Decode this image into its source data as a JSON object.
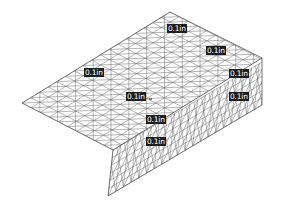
{
  "figure": {
    "colors": {
      "background": "#ffffff",
      "mesh_line": "#6e6e6e",
      "outline": "#555555",
      "label_bg": "#1e1e1e",
      "label_text": "#ffffff"
    },
    "labels": [
      {
        "text": "0.1in",
        "x": 167,
        "y": 24
      },
      {
        "text": "0.1in",
        "x": 206,
        "y": 46
      },
      {
        "text": "0.1in",
        "x": 84,
        "y": 68
      },
      {
        "text": "0.1in",
        "x": 229,
        "y": 69
      },
      {
        "text": "0.1in",
        "x": 126,
        "y": 92
      },
      {
        "text": "0.1in",
        "x": 229,
        "y": 92
      },
      {
        "text": "0.1in",
        "x": 146,
        "y": 115
      },
      {
        "text": "0.1in",
        "x": 146,
        "y": 137
      }
    ]
  }
}
